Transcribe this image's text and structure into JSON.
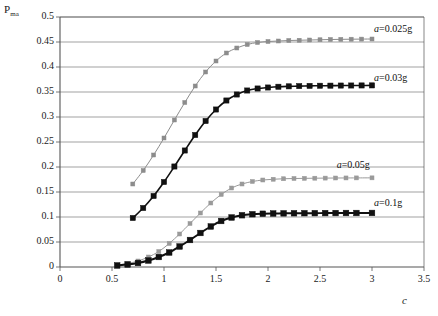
{
  "chart_data": {
    "type": "line",
    "title": "",
    "subtitle": "",
    "xlabel": "c",
    "ylabel": "P",
    "ylabel_subscript": "ma",
    "xlim": [
      0,
      3.5
    ],
    "ylim": [
      0,
      0.5
    ],
    "xticks": [
      0,
      0.5,
      1,
      1.5,
      2,
      2.5,
      3,
      3.5
    ],
    "xtick_labels": [
      "0",
      "0.5",
      "1",
      "1.5",
      "2",
      "2.5",
      "3",
      "3.5"
    ],
    "yticks": [
      0,
      0.05,
      0.1,
      0.15,
      0.2,
      0.25,
      0.3,
      0.35,
      0.4,
      0.45,
      0.5
    ],
    "ytick_labels": [
      "0",
      "0.05",
      "0.1",
      "0.15",
      "0.2",
      "0.25",
      "0.3",
      "0.35",
      "0.4",
      "0.45",
      "0.5"
    ],
    "grid": "horizontal",
    "legend_position": "inline-right",
    "series": [
      {
        "name": "a=0.025g",
        "label_prefix": "a",
        "label_rest": "=0.025g",
        "color": "#8c8c8c",
        "marker": "square-small",
        "marker_size": 2.0,
        "line_width": 1.0,
        "label_x": 3.02,
        "label_y": 0.477,
        "x": [
          0.7,
          0.8,
          0.9,
          1.0,
          1.1,
          1.2,
          1.3,
          1.4,
          1.5,
          1.6,
          1.7,
          1.8,
          1.9,
          2.0,
          2.1,
          2.2,
          2.3,
          2.4,
          2.5,
          2.6,
          2.7,
          2.8,
          2.9,
          3.0
        ],
        "y": [
          0.166,
          0.193,
          0.224,
          0.258,
          0.294,
          0.329,
          0.362,
          0.39,
          0.412,
          0.428,
          0.438,
          0.445,
          0.449,
          0.451,
          0.452,
          0.453,
          0.4535,
          0.454,
          0.4545,
          0.455,
          0.4553,
          0.4556,
          0.4558,
          0.456
        ]
      },
      {
        "name": "a=0.03g",
        "label_prefix": "a",
        "label_rest": "=0.03g",
        "color": "#111111",
        "marker": "square-filled",
        "marker_size": 2.6,
        "line_width": 1.6,
        "label_x": 3.02,
        "label_y": 0.378,
        "x": [
          0.7,
          0.8,
          0.9,
          1.0,
          1.1,
          1.2,
          1.3,
          1.4,
          1.5,
          1.6,
          1.7,
          1.8,
          1.9,
          2.0,
          2.1,
          2.2,
          2.3,
          2.4,
          2.5,
          2.6,
          2.7,
          2.8,
          2.9,
          3.0
        ],
        "y": [
          0.098,
          0.118,
          0.142,
          0.17,
          0.201,
          0.233,
          0.264,
          0.292,
          0.315,
          0.333,
          0.345,
          0.353,
          0.357,
          0.359,
          0.3605,
          0.3613,
          0.3618,
          0.3622,
          0.3625,
          0.3627,
          0.3629,
          0.363,
          0.3631,
          0.3632
        ]
      },
      {
        "name": "a=0.05g",
        "label_prefix": "a",
        "label_rest": "=0.05g",
        "color": "#9a9a9a",
        "marker": "square-small",
        "marker_size": 2.0,
        "line_width": 1.0,
        "label_x": 2.66,
        "label_y": 0.205,
        "x": [
          0.55,
          0.65,
          0.75,
          0.85,
          0.95,
          1.05,
          1.15,
          1.25,
          1.35,
          1.45,
          1.55,
          1.65,
          1.75,
          1.85,
          1.95,
          2.05,
          2.15,
          2.25,
          2.35,
          2.45,
          2.55,
          2.65,
          2.75,
          2.85,
          3.0
        ],
        "y": [
          0.004,
          0.007,
          0.012,
          0.02,
          0.031,
          0.047,
          0.066,
          0.087,
          0.108,
          0.128,
          0.145,
          0.158,
          0.166,
          0.171,
          0.174,
          0.1755,
          0.1765,
          0.177,
          0.1773,
          0.1776,
          0.1778,
          0.178,
          0.1781,
          0.1782,
          0.1783
        ]
      },
      {
        "name": "a=0.1g",
        "label_prefix": "a",
        "label_rest": "=0.1g",
        "color": "#111111",
        "marker": "square-filled",
        "marker_size": 2.8,
        "line_width": 2.0,
        "label_x": 3.02,
        "label_y": 0.128,
        "x": [
          0.55,
          0.65,
          0.75,
          0.85,
          0.95,
          1.05,
          1.15,
          1.25,
          1.35,
          1.45,
          1.55,
          1.65,
          1.75,
          1.85,
          1.95,
          2.05,
          2.15,
          2.25,
          2.35,
          2.45,
          2.55,
          2.65,
          2.75,
          2.85,
          3.0
        ],
        "y": [
          0.003,
          0.005,
          0.008,
          0.013,
          0.02,
          0.029,
          0.041,
          0.054,
          0.068,
          0.081,
          0.092,
          0.099,
          0.1035,
          0.1055,
          0.1065,
          0.107,
          0.1073,
          0.1075,
          0.1076,
          0.1077,
          0.1078,
          0.1079,
          0.108,
          0.108,
          0.1081
        ]
      }
    ]
  }
}
